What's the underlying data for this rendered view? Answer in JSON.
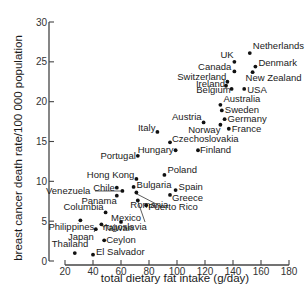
{
  "chart_data": {
    "type": "scatter",
    "title": "",
    "xlabel": "total dietary fat intake (g/day)",
    "ylabel": "breast cancer death rate/100 000 population",
    "xlim": [
      20,
      180
    ],
    "ylim": [
      0,
      30
    ],
    "x_ticks": [
      20,
      40,
      60,
      80,
      100,
      120,
      140,
      160,
      180
    ],
    "y_ticks": [
      0,
      5,
      10,
      15,
      20,
      25,
      30
    ],
    "grid": false,
    "legend": null,
    "points": [
      {
        "label": "Netherlands",
        "x": 152,
        "y": 26.1
      },
      {
        "label": "UK",
        "x": 141,
        "y": 25.0
      },
      {
        "label": "Denmark",
        "x": 156,
        "y": 24.4
      },
      {
        "label": "Canada",
        "x": 141,
        "y": 23.8
      },
      {
        "label": "New Zealand",
        "x": 154,
        "y": 23.7
      },
      {
        "label": "Switzerland",
        "x": 136,
        "y": 22.5
      },
      {
        "label": "Ireland",
        "x": 135,
        "y": 22.0
      },
      {
        "label": "Belgium",
        "x": 139,
        "y": 21.6
      },
      {
        "label": "USA",
        "x": 148,
        "y": 21.6
      },
      {
        "label": "Australia",
        "x": 131,
        "y": 19.6
      },
      {
        "label": "Sweden",
        "x": 132,
        "y": 18.9
      },
      {
        "label": "Germany",
        "x": 134,
        "y": 17.8
      },
      {
        "label": "Austria",
        "x": 119,
        "y": 17.4
      },
      {
        "label": "Norway",
        "x": 131,
        "y": 17.1
      },
      {
        "label": "France",
        "x": 137,
        "y": 16.6
      },
      {
        "label": "Italy",
        "x": 86,
        "y": 16.2
      },
      {
        "label": "Czechoslovakia",
        "x": 95,
        "y": 14.9
      },
      {
        "label": "Hungary",
        "x": 99,
        "y": 13.9
      },
      {
        "label": "Finland",
        "x": 115,
        "y": 13.9
      },
      {
        "label": "Portugal",
        "x": 72,
        "y": 13.2
      },
      {
        "label": "Poland",
        "x": 91,
        "y": 10.8
      },
      {
        "label": "Hong Kong",
        "x": 71,
        "y": 10.3
      },
      {
        "label": "Bulgaria",
        "x": 69,
        "y": 9.3
      },
      {
        "label": "Chile",
        "x": 57,
        "y": 9.2
      },
      {
        "label": "Spain",
        "x": 99,
        "y": 8.9
      },
      {
        "label": "Venezuela",
        "x": 61,
        "y": 8.8
      },
      {
        "label": "Romania",
        "x": 71,
        "y": 8.6
      },
      {
        "label": "Greece",
        "x": 95,
        "y": 8.3
      },
      {
        "label": "Panama",
        "x": 57,
        "y": 8.2
      },
      {
        "label": "Yugoslavia",
        "x": 72,
        "y": 7.6
      },
      {
        "label": "Puerto Rico",
        "x": 78,
        "y": 7.0
      },
      {
        "label": "Columbia",
        "x": 49,
        "y": 6.1
      },
      {
        "label": "Philippines",
        "x": 31,
        "y": 5.1
      },
      {
        "label": "Mexico",
        "x": 60,
        "y": 4.9
      },
      {
        "label": "Taiwan",
        "x": 46,
        "y": 4.6
      },
      {
        "label": "Japan",
        "x": 42,
        "y": 4.0
      },
      {
        "label": "Ceylon",
        "x": 48,
        "y": 2.6
      },
      {
        "label": "Thailand",
        "x": 27,
        "y": 1.0
      },
      {
        "label": "El Salvador",
        "x": 40,
        "y": 0.8
      }
    ]
  },
  "layout": {
    "plot": {
      "x0": 65,
      "x1": 289,
      "y0": 261,
      "y1": 22
    },
    "labels": {
      "Netherlands": {
        "dx": 3,
        "dy": -4,
        "anchor": "start"
      },
      "UK": {
        "dx": -14,
        "dy": -4,
        "anchor": "start"
      },
      "Denmark": {
        "dx": 3,
        "dy": -1,
        "anchor": "start"
      },
      "Canada": {
        "dx": -3,
        "dy": -1,
        "anchor": "end"
      },
      "New Zealand": {
        "dx": -7,
        "dy": 9,
        "anchor": "start"
      },
      "Switzerland": {
        "dx": -1,
        "dy": -2,
        "anchor": "end"
      },
      "Ireland": {
        "dx": -1,
        "dy": 1,
        "anchor": "end"
      },
      "Belgium": {
        "dx": -1,
        "dy": 4,
        "anchor": "end"
      },
      "USA": {
        "dx": 3,
        "dy": 4,
        "anchor": "start"
      },
      "Australia": {
        "dx": 3,
        "dy": -3,
        "anchor": "start"
      },
      "Sweden": {
        "dx": 3,
        "dy": 3,
        "anchor": "start"
      },
      "Germany": {
        "dx": 3,
        "dy": 3,
        "anchor": "start"
      },
      "Austria": {
        "dx": -2,
        "dy": -2,
        "anchor": "end"
      },
      "Norway": {
        "dx": 0,
        "dy": 8,
        "anchor": "end"
      },
      "France": {
        "dx": 3,
        "dy": 3,
        "anchor": "start"
      },
      "Italy": {
        "dx": -2,
        "dy": -1,
        "anchor": "end"
      },
      "Czechoslovakia": {
        "dx": 2,
        "dy": 0,
        "anchor": "start"
      },
      "Hungary": {
        "dx": -2,
        "dy": 3,
        "anchor": "end"
      },
      "Finland": {
        "dx": 2,
        "dy": 3,
        "anchor": "start"
      },
      "Portugal": {
        "dx": -2,
        "dy": 3,
        "anchor": "end"
      },
      "Poland": {
        "dx": 3,
        "dy": -2,
        "anchor": "start"
      },
      "Hong Kong": {
        "dx": -2,
        "dy": -1,
        "anchor": "end"
      },
      "Bulgaria": {
        "dx": 3,
        "dy": 1,
        "anchor": "start"
      },
      "Chile": {
        "dx": -2,
        "dy": 3,
        "anchor": "end"
      },
      "Spain": {
        "dx": 3,
        "dy": 0,
        "anchor": "start"
      },
      "Venezuela": {
        "dx": -32,
        "dy": 3,
        "anchor": "end"
      },
      "Romania": {
        "dx": 32,
        "dy": 16,
        "anchor": "end"
      },
      "Greece": {
        "dx": 2,
        "dy": 6,
        "anchor": "start"
      },
      "Panama": {
        "dx": 0,
        "dy": 8,
        "anchor": "end"
      },
      "Yugoslavia": {
        "dx": 9,
        "dy": 30,
        "anchor": "end"
      },
      "Puerto Rico": {
        "dx": 2,
        "dy": 5,
        "anchor": "start"
      },
      "Columbia": {
        "dx": -2,
        "dy": -2,
        "anchor": "end"
      },
      "Philippines": {
        "dx": -32,
        "dy": 10,
        "anchor": "start"
      },
      "Mexico": {
        "dx": -10,
        "dy": -1,
        "anchor": "start"
      },
      "Taiwan": {
        "dx": 2,
        "dy": 7,
        "anchor": "start"
      },
      "Japan": {
        "dx": -2,
        "dy": 11,
        "anchor": "end"
      },
      "Ceylon": {
        "dx": 2,
        "dy": 3,
        "anchor": "start"
      },
      "Thailand": {
        "dx": -23,
        "dy": -6,
        "anchor": "start"
      },
      "El Salvador": {
        "dx": 3,
        "dy": 0,
        "anchor": "start"
      }
    },
    "leaders": [
      {
        "from": "Venezuela",
        "x1": 95,
        "y1": 191,
        "x2": 123,
        "y2": 191
      },
      {
        "from": "Romania",
        "x1": 135,
        "y1": 193,
        "x2": 162,
        "y2": 207
      },
      {
        "from": "Yugoslavia",
        "x1": 137,
        "y1": 199,
        "x2": 145,
        "y2": 222
      },
      {
        "from": "Japan",
        "x1": 94,
        "y1": 232,
        "x2": 96,
        "y2": 229
      }
    ]
  }
}
